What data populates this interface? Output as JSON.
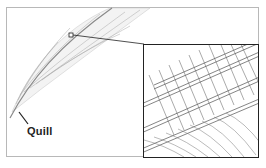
{
  "diagram": {
    "labels": {
      "quill": "Quill"
    },
    "inset": {
      "description": "magnified view of barbs and barbules"
    },
    "colors": {
      "line": "#222222",
      "feather_stroke": "#9a9a9a",
      "frame": "#b8b8b8"
    }
  }
}
